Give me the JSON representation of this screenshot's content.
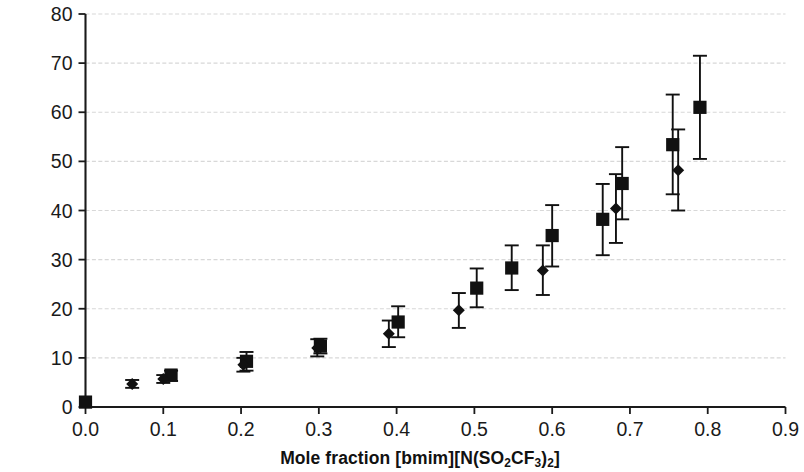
{
  "chart_data": {
    "type": "scatter",
    "title": "",
    "xlabel": "Mole fraction [bmim][N(SO2CF3)2]",
    "xlabel_html": "Mole fraction [bmim][N(SO<sub>2</sub>CF<sub>3</sub>)<sub>2</sub>]",
    "ylabel": "k2 (salt mixture) / k2 (ethanol)",
    "ylabel_html": "<span class=\"it\">k</span><sub>2</sub> (salt mixture) / <span class=\"it\">k</span><sub>2</sub> (ethanol)",
    "xlim": [
      0.0,
      0.9
    ],
    "ylim": [
      0,
      80
    ],
    "xticks": [
      "0.0",
      "0.1",
      "0.2",
      "0.3",
      "0.4",
      "0.5",
      "0.6",
      "0.7",
      "0.8",
      "0.9"
    ],
    "xtick_values": [
      0.0,
      0.1,
      0.2,
      0.3,
      0.4,
      0.5,
      0.6,
      0.7,
      0.8,
      0.9
    ],
    "yticks": [
      "0",
      "10",
      "20",
      "30",
      "40",
      "50",
      "60",
      "70",
      "80"
    ],
    "ytick_values": [
      0,
      10,
      20,
      30,
      40,
      50,
      60,
      70,
      80
    ],
    "grid": "horizontal",
    "grid_color": "#d8d8d8",
    "legend": "none",
    "marker_color": "#111111",
    "series": [
      {
        "name": "square-series",
        "marker": "square",
        "points": [
          {
            "x": 0.0,
            "y": 1.0,
            "err_low": 0.0,
            "err_high": 0.0
          },
          {
            "x": 0.11,
            "y": 6.5,
            "err_low": 5.3,
            "err_high": 7.4
          },
          {
            "x": 0.207,
            "y": 9.3,
            "err_low": 7.4,
            "err_high": 11.2
          },
          {
            "x": 0.302,
            "y": 12.4,
            "err_low": 10.9,
            "err_high": 13.9
          },
          {
            "x": 0.402,
            "y": 17.3,
            "err_low": 14.2,
            "err_high": 20.5
          },
          {
            "x": 0.503,
            "y": 24.2,
            "err_low": 20.3,
            "err_high": 28.2
          },
          {
            "x": 0.548,
            "y": 28.3,
            "err_low": 23.8,
            "err_high": 32.9
          },
          {
            "x": 0.6,
            "y": 34.9,
            "err_low": 28.6,
            "err_high": 41.1
          },
          {
            "x": 0.665,
            "y": 38.2,
            "err_low": 30.9,
            "err_high": 45.4
          },
          {
            "x": 0.69,
            "y": 45.5,
            "err_low": 38.2,
            "err_high": 52.9
          },
          {
            "x": 0.755,
            "y": 53.4,
            "err_low": 43.3,
            "err_high": 63.6
          },
          {
            "x": 0.79,
            "y": 61.0,
            "err_low": 50.5,
            "err_high": 71.5
          }
        ]
      },
      {
        "name": "diamond-series",
        "marker": "diamond",
        "points": [
          {
            "x": 0.06,
            "y": 4.7,
            "err_low": 3.9,
            "err_high": 5.5
          },
          {
            "x": 0.1,
            "y": 5.7,
            "err_low": 4.9,
            "err_high": 6.5
          },
          {
            "x": 0.203,
            "y": 8.6,
            "err_low": 7.2,
            "err_high": 10.0
          },
          {
            "x": 0.298,
            "y": 12.0,
            "err_low": 10.3,
            "err_high": 13.8
          },
          {
            "x": 0.39,
            "y": 14.9,
            "err_low": 12.2,
            "err_high": 17.6
          },
          {
            "x": 0.48,
            "y": 19.7,
            "err_low": 16.1,
            "err_high": 23.2
          },
          {
            "x": 0.588,
            "y": 27.8,
            "err_low": 22.8,
            "err_high": 32.9
          },
          {
            "x": 0.682,
            "y": 40.4,
            "err_low": 33.4,
            "err_high": 47.4
          },
          {
            "x": 0.762,
            "y": 48.2,
            "err_low": 40.0,
            "err_high": 56.5
          }
        ]
      }
    ]
  }
}
